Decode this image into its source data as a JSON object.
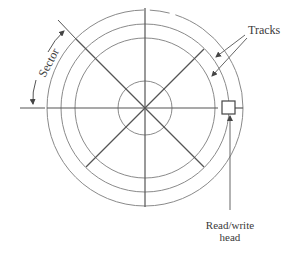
{
  "diagram": {
    "labels": {
      "tracks": "Tracks",
      "sector": "Sector",
      "head_line1": "Read/write",
      "head_line2": "head"
    },
    "geometry": {
      "center": [
        145,
        108
      ],
      "track_radii": [
        70,
        84,
        98
      ],
      "hub_radius": 27,
      "sector_spokes": 8
    },
    "colors": {
      "line": "#555555",
      "track": "#8a8a8a",
      "text": "#3a3a3a"
    }
  }
}
